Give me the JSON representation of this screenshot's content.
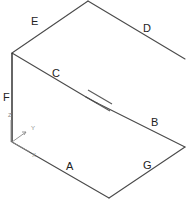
{
  "diagram": {
    "type": "isometric-wireframe",
    "edge_labels": {
      "A": "A",
      "B": "B",
      "C": "C",
      "D": "D",
      "E": "E",
      "F": "F",
      "G": "G"
    },
    "axis_triad": {
      "x": "X",
      "y": "Y",
      "z": "Z"
    },
    "colors": {
      "edge": "#4a4a4a",
      "label": "#222222",
      "axis": "#8a8a8a",
      "background": "#ffffff"
    }
  }
}
